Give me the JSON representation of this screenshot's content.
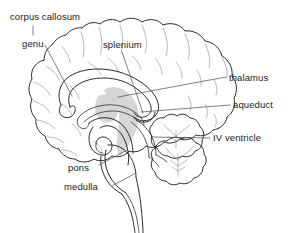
{
  "figure": {
    "type": "anatomical-line-diagram",
    "background_color": "#ffffff",
    "line_color": "#2b2b2b",
    "faint_line_color": "#9a9a9a",
    "shading_color": "#cfcfcf",
    "text_color": "#1a1a1a",
    "width": 295,
    "height": 233
  },
  "labels": [
    {
      "id": "corpus-callosum",
      "text": "corpus callosum",
      "x": 10,
      "y": 11,
      "leader": "vertical tick descending from label to genu label",
      "side": "upper-left"
    },
    {
      "id": "genu",
      "text": "genu",
      "x": 22,
      "y": 38,
      "leader": "diagonal line running down-right to anterior corpus callosum",
      "side": "left"
    },
    {
      "id": "splenium",
      "text": "splenium",
      "x": 103,
      "y": 39,
      "leader": "diagonal line running down-left to posterior corpus callosum",
      "side": "upper-center"
    },
    {
      "id": "thalamus",
      "text": "thalamus",
      "x": 229,
      "y": 72,
      "leader": "long horizontal line running left into the shaded thalamus",
      "side": "right"
    },
    {
      "id": "aqueduct",
      "text": "aqueduct",
      "x": 233,
      "y": 99,
      "leader": "long horizontal line running left to the cerebral aqueduct",
      "side": "right"
    },
    {
      "id": "iv-ventricle",
      "text": "IV ventricle",
      "x": 213,
      "y": 132,
      "leader": "horizontal line running left to the fourth ventricle",
      "side": "right"
    },
    {
      "id": "pons",
      "text": "pons",
      "x": 68,
      "y": 162,
      "leader": "diagonal line running up-right to the pons",
      "side": "lower-left"
    },
    {
      "id": "medulla",
      "text": "medulla",
      "x": 64,
      "y": 181,
      "leader": "diagonal line running up-right to the medulla oblongata",
      "side": "lower-left"
    }
  ],
  "structures": [
    "cerebral cortex with gyri and sulci",
    "corpus callosum",
    "genu of corpus callosum",
    "splenium of corpus callosum",
    "fornix",
    "thalamus (shaded)",
    "cerebral aqueduct",
    "cerebellum with arbor vitae",
    "fourth ventricle",
    "midbrain",
    "pons",
    "medulla oblongata",
    "spinal cord"
  ]
}
